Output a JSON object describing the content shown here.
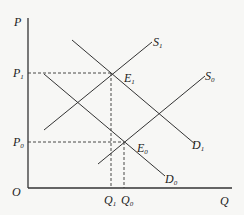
{
  "diagram": {
    "type": "supply-demand",
    "axes": {
      "y_label": "P",
      "x_label": "Q",
      "origin_label": "O"
    },
    "price_labels": [
      {
        "main": "P",
        "sub": "1"
      },
      {
        "main": "P",
        "sub": "0"
      }
    ],
    "quantity_labels": [
      {
        "main": "Q",
        "sub": "1"
      },
      {
        "main": "Q",
        "sub": "0"
      }
    ],
    "curves": [
      {
        "id": "S1",
        "main": "S",
        "sub": "1",
        "kind": "supply"
      },
      {
        "id": "S0",
        "main": "S",
        "sub": "0",
        "kind": "supply"
      },
      {
        "id": "D1",
        "main": "D",
        "sub": "1",
        "kind": "demand"
      },
      {
        "id": "D0",
        "main": "D",
        "sub": "0",
        "kind": "demand"
      }
    ],
    "equilibria": [
      {
        "id": "E1",
        "main": "E",
        "sub": "1",
        "price": "P1",
        "quantity": "Q1"
      },
      {
        "id": "E0",
        "main": "E",
        "sub": "0",
        "price": "P0",
        "quantity": "Q0"
      }
    ],
    "colors": {
      "line": "#333333",
      "background": "#f7f7f5"
    }
  }
}
